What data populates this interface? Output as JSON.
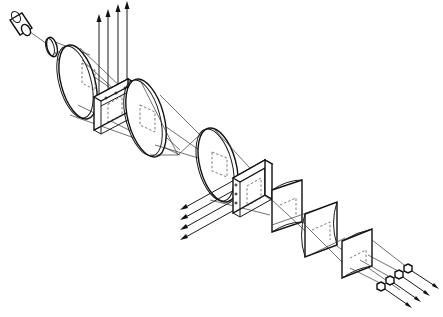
{
  "diagram": {
    "type": "optical-system-exploded-view",
    "background": "#ffffff",
    "stroke_color": "#1a1a1a",
    "components": [
      {
        "id": "light-source",
        "shape": "cylinder"
      },
      {
        "id": "small-lens",
        "shape": "ring"
      },
      {
        "id": "lens-1",
        "shape": "large-disc-lens"
      },
      {
        "id": "beam-splitter-1",
        "shape": "square-frame"
      },
      {
        "id": "lens-2",
        "shape": "large-disc-lens"
      },
      {
        "id": "lens-3",
        "shape": "large-disc-lens"
      },
      {
        "id": "beam-splitter-2",
        "shape": "square-frame"
      },
      {
        "id": "cylindrical-lens-1",
        "shape": "concave-block"
      },
      {
        "id": "cylindrical-lens-2",
        "shape": "concave-block"
      },
      {
        "id": "cylindrical-lens-3",
        "shape": "concave-block"
      },
      {
        "id": "detectors",
        "shape": "hexagon-array",
        "count": 4
      }
    ],
    "output_beams": [
      {
        "id": "upward-beams",
        "count": 4,
        "direction": "up"
      },
      {
        "id": "left-beams",
        "count": 4,
        "direction": "down-left"
      },
      {
        "id": "right-beams",
        "count": 4,
        "direction": "down-right"
      }
    ],
    "labels": []
  }
}
